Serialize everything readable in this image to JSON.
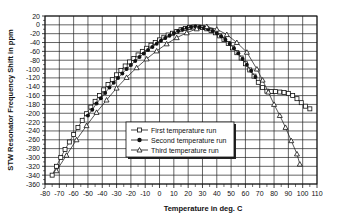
{
  "chart_data": {
    "type": "scatter",
    "title": "",
    "xlabel": "Temperature in deg. C",
    "ylabel": "STW Resonator Frequency Shift in ppm",
    "xlim": [
      -80,
      110
    ],
    "ylim": [
      -360,
      20
    ],
    "grid": true,
    "legend_position": "inside-center-lower",
    "x_ticks": [
      -80,
      -70,
      -60,
      -50,
      -40,
      -30,
      -20,
      -10,
      0,
      10,
      20,
      30,
      40,
      50,
      60,
      70,
      80,
      90,
      100,
      110
    ],
    "y_ticks": [
      20,
      0,
      -20,
      -40,
      -60,
      -80,
      -100,
      -120,
      -140,
      -160,
      -180,
      -200,
      -220,
      -240,
      -260,
      -280,
      -300,
      -320,
      -340,
      -360
    ],
    "series": [
      {
        "name": "First temperature run",
        "marker": "open-square",
        "x": [
          -75,
          -72,
          -69,
          -66,
          -63,
          -60,
          -57,
          -54,
          -51,
          -48,
          -45,
          -42,
          -39,
          -36,
          -33,
          -30,
          -27,
          -24,
          -21,
          -18,
          -15,
          -12,
          -9,
          -6,
          -3,
          0,
          3,
          6,
          9,
          12,
          15,
          18,
          21,
          24,
          27,
          30,
          33,
          36,
          39,
          42,
          45,
          48,
          51,
          54,
          57,
          60,
          63,
          66,
          69,
          72,
          75,
          78,
          81,
          84,
          87,
          90,
          93,
          96,
          99,
          102,
          105
        ],
        "y": [
          -340,
          -320,
          -300,
          -282,
          -265,
          -248,
          -232,
          -216,
          -201,
          -186,
          -173,
          -160,
          -147,
          -135,
          -124,
          -113,
          -103,
          -93,
          -84,
          -76,
          -68,
          -60,
          -53,
          -46,
          -40,
          -34,
          -28,
          -23,
          -19,
          -15,
          -11,
          -8,
          -6,
          -5,
          -5,
          -6,
          -9,
          -13,
          -18,
          -25,
          -33,
          -42,
          -52,
          -63,
          -75,
          -88,
          -102,
          -116,
          -130,
          -142,
          -150,
          -151,
          -151,
          -152,
          -153,
          -155,
          -160,
          -167,
          -176,
          -184,
          -190
        ]
      },
      {
        "name": "Second temperature run",
        "marker": "filled-circle",
        "x": [
          -50,
          -47,
          -44,
          -41,
          -38,
          -35,
          -32,
          -29,
          -26,
          -23,
          -20,
          -17,
          -14,
          -11,
          -8,
          -5,
          -2,
          1,
          4,
          7,
          10,
          13,
          16,
          19,
          22,
          25,
          28,
          31,
          34,
          37,
          40,
          43,
          46,
          49,
          52,
          55,
          58,
          61,
          64,
          67
        ],
        "y": [
          -205,
          -192,
          -178,
          -166,
          -154,
          -142,
          -131,
          -120,
          -110,
          -100,
          -91,
          -82,
          -73,
          -65,
          -57,
          -50,
          -43,
          -36,
          -30,
          -24,
          -19,
          -14,
          -10,
          -7,
          -5,
          -4,
          -5,
          -7,
          -10,
          -14,
          -19,
          -26,
          -34,
          -43,
          -53,
          -64,
          -77,
          -90,
          -104,
          -118
        ]
      },
      {
        "name": "Third temperature run",
        "marker": "open-triangle",
        "x": [
          -72,
          -65,
          -58,
          -51,
          -44,
          -37,
          -30,
          -23,
          -16,
          -9,
          -2,
          5,
          12,
          19,
          26,
          33,
          40,
          47,
          54,
          61,
          68,
          72,
          76,
          80,
          84,
          88,
          92,
          96,
          98
        ],
        "y": [
          -330,
          -295,
          -260,
          -228,
          -198,
          -170,
          -143,
          -119,
          -97,
          -77,
          -59,
          -43,
          -29,
          -18,
          -9,
          -4,
          -10,
          -22,
          -40,
          -62,
          -100,
          -125,
          -152,
          -180,
          -205,
          -232,
          -262,
          -292,
          -315
        ]
      }
    ]
  },
  "legend": {
    "items": [
      {
        "label": "First temperature run"
      },
      {
        "label": "Second temperature run"
      },
      {
        "label": "Third temperature run"
      }
    ]
  },
  "axes": {
    "xlabel": "Temperature in deg. C",
    "ylabel": "STW Resonator Frequency Shift in ppm"
  }
}
